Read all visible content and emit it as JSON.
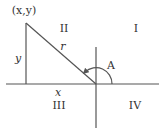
{
  "diagram": {
    "colors": {
      "line": "#555555",
      "text": "#333333",
      "background": "#ffffff"
    },
    "point_label": "(x,y)",
    "side_labels": {
      "hypotenuse": "r",
      "vertical": "y",
      "horizontal": "x"
    },
    "angle_label": "A",
    "quadrants": {
      "q1": "I",
      "q2": "II",
      "q3": "III",
      "q4": "IV"
    },
    "geometry": {
      "origin": [
        96,
        84
      ],
      "point": [
        26,
        23
      ],
      "foot": [
        26,
        84
      ],
      "x_axis": [
        6,
        159
      ],
      "y_axis": [
        47,
        128
      ]
    }
  }
}
